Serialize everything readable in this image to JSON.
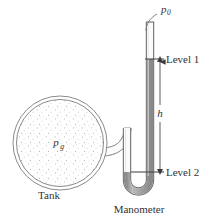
{
  "figure": {
    "kind": "manometer-diagram",
    "labels": {
      "ambient_pressure": "p",
      "ambient_pressure_sub": "0",
      "gauge_pressure": "p",
      "gauge_pressure_sub": "g",
      "level_top": "Level 1",
      "level_bottom": "Level 2",
      "height": "h",
      "tank": "Tank",
      "manometer": "Manometer"
    },
    "colors": {
      "outline": "#7a7a7a",
      "tube_wall": "#6e6e6e",
      "fluid": "#a8a8a8",
      "fluid_dark": "#8f8f8f",
      "stipple": "#b9b9b9",
      "text": "#333333",
      "background": "#ffffff",
      "leader": "#555555"
    },
    "geometry": {
      "tank_center_x": 60,
      "tank_center_y": 143,
      "tank_radius_outer": 47,
      "tank_radius_inner": 43,
      "tube_top_y": 22,
      "level1_y": 59,
      "level2_y": 172,
      "right_tube_x": 150,
      "left_tube_x": 127,
      "bend_bottom_y": 195
    }
  }
}
